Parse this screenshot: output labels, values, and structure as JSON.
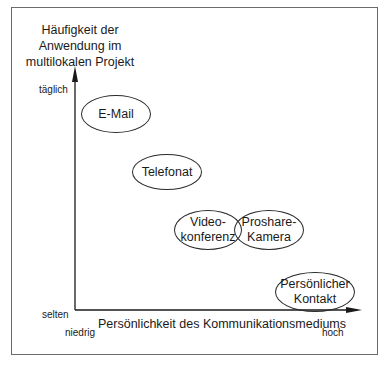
{
  "diagram": {
    "y_axis": {
      "title_lines": [
        "Häufigkeit der",
        "Anwendung im",
        "multilokalen Projekt"
      ],
      "high_label": "täglich",
      "low_label": "selten"
    },
    "x_axis": {
      "title": "Persönlichkeit des Kommunikationsmediums",
      "low_label": "niedrig",
      "high_label": "hoch"
    },
    "nodes": [
      {
        "id": "email",
        "lines": [
          "E-Mail"
        ]
      },
      {
        "id": "telefonat",
        "lines": [
          "Telefonat"
        ]
      },
      {
        "id": "videokonferenz",
        "lines": [
          "Video-",
          "konferenz"
        ]
      },
      {
        "id": "proshare",
        "lines": [
          "Proshare-",
          "Kamera"
        ]
      },
      {
        "id": "persoenlich",
        "lines": [
          "Persönlicher",
          "Kontakt"
        ]
      }
    ],
    "colors": {
      "line": "#1a1a1a",
      "frame": "#6a6a6a",
      "background": "#ffffff"
    }
  }
}
